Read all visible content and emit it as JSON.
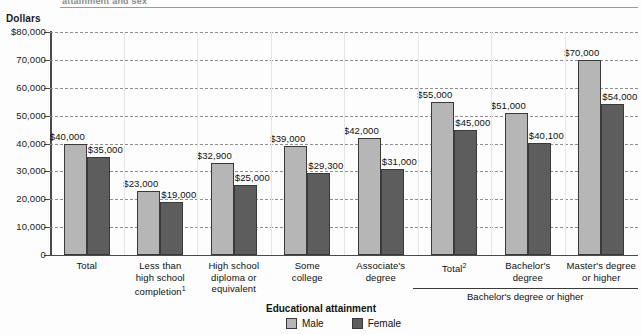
{
  "top_cut_title": "attainment and sex",
  "axis": {
    "y_title": "Dollars",
    "ticks": [
      "$80,000",
      "70,000",
      "60,000",
      "50,000",
      "40,000",
      "30,000",
      "20,000",
      "10,000",
      "0"
    ]
  },
  "legend": {
    "title": "Educational attainment",
    "male_label": "Male",
    "female_label": "Female",
    "male_color": "#b6b6b6",
    "female_color": "#5d5d5d"
  },
  "bracket": {
    "label": "Bachelor's degree or higher"
  },
  "chart_data": {
    "type": "bar",
    "title": "attainment and sex",
    "xlabel": "Educational attainment",
    "ylabel": "Dollars",
    "ylim": [
      0,
      80000
    ],
    "yticks": [
      0,
      10000,
      20000,
      30000,
      40000,
      50000,
      60000,
      70000,
      80000
    ],
    "grid": true,
    "legend_position": "bottom-center",
    "categories": [
      "Total",
      "Less than high school completion¹",
      "High school diploma or equivalent",
      "Some college",
      "Associate's degree",
      "Total²",
      "Bachelor's degree",
      "Master's degree or higher"
    ],
    "category_lines": [
      [
        "Total"
      ],
      [
        "Less than",
        "high school",
        "completion"
      ],
      [
        "High school",
        "diploma or",
        "equivalent"
      ],
      [
        "Some",
        "college"
      ],
      [
        "Associate's",
        "degree"
      ],
      [
        "Total"
      ],
      [
        "Bachelor's",
        "degree"
      ],
      [
        "Master's degree",
        "or higher"
      ]
    ],
    "category_footnotes": [
      "",
      "1",
      "",
      "",
      "",
      "2",
      "",
      ""
    ],
    "series": [
      {
        "name": "Male",
        "values": [
          40000,
          23000,
          32900,
          39000,
          42000,
          55000,
          51000,
          70000
        ],
        "labels": [
          "$40,000",
          "$23,000",
          "$32,900",
          "$39,000",
          "$42,000",
          "$55,000",
          "$51,000",
          "$70,000"
        ]
      },
      {
        "name": "Female",
        "values": [
          35000,
          19000,
          25000,
          29300,
          31000,
          45000,
          40100,
          54000
        ],
        "labels": [
          "$35,000",
          "$19,000",
          "$25,000",
          "$29,300",
          "$31,000",
          "$45,000",
          "$40,100",
          "$54,000"
        ]
      }
    ],
    "bracket_groups": [
      {
        "label": "Bachelor's degree or higher",
        "categories": [
          "Total²",
          "Bachelor's degree",
          "Master's degree or higher"
        ]
      }
    ]
  }
}
